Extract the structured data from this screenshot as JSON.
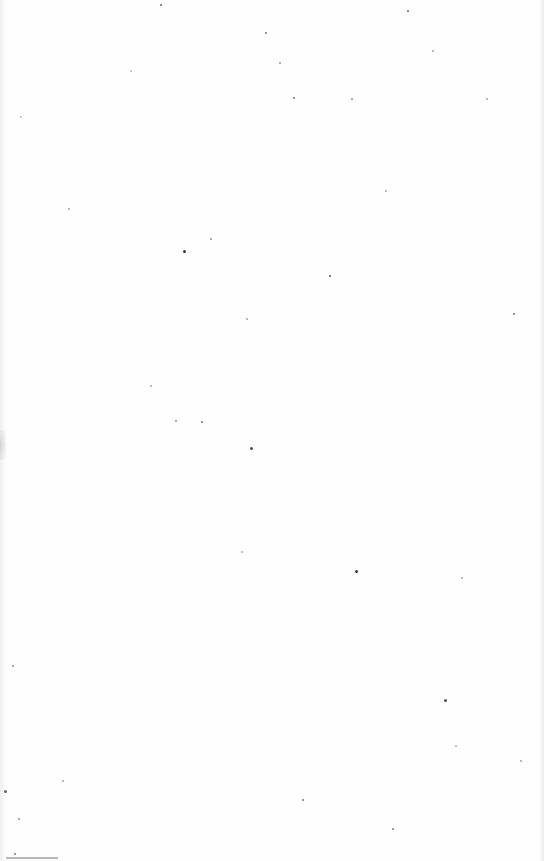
{
  "document": {
    "type": "blank scanned page",
    "text": ""
  }
}
